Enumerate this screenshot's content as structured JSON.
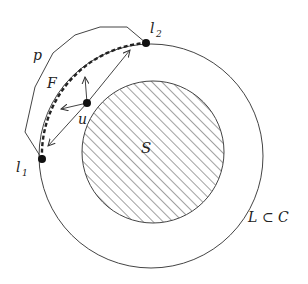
{
  "diagram": {
    "labels": {
      "p": "p",
      "F": "F",
      "u": "u",
      "S": "S",
      "l1": "l",
      "l1_sub": "1",
      "l2": "l",
      "l2_sub": "2",
      "LC": "L ⊂ C"
    },
    "colors": {
      "stroke": "#333333",
      "background": "#ffffff"
    },
    "shapes": {
      "outer_circle": {
        "name": "L",
        "cx": 151,
        "cy": 156,
        "r": 112
      },
      "inner_circle": {
        "name": "S",
        "cx": 153,
        "cy": 152,
        "r": 71,
        "fill": "hatched"
      },
      "polygon_p": {
        "points": "146,43 127,27 100,27 75,35 53,53 35,87 25,132 42,159"
      },
      "point_l1": {
        "x": 42,
        "y": 159
      },
      "point_l2": {
        "x": 146,
        "y": 43
      },
      "point_u": {
        "x": 87,
        "y": 103
      }
    }
  }
}
